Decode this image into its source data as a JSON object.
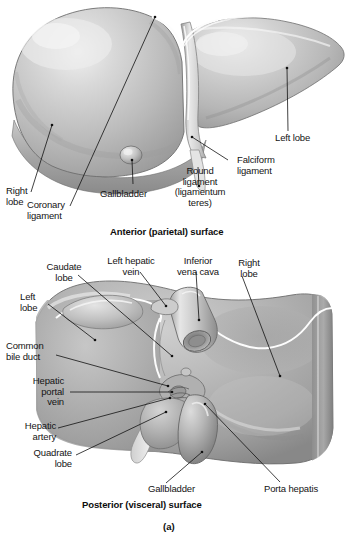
{
  "figure": {
    "panel_letter": "(a)",
    "colors": {
      "ink": "#141414",
      "leader_line": "#111111",
      "liver_mid": "#b4b4b4",
      "liver_light": "#dcdcdc",
      "liver_dark": "#8f8f8f",
      "highlight": "#f2f2f2",
      "background": "#ffffff"
    }
  },
  "panels": [
    {
      "id": "anterior",
      "caption": "Anterior (parietal) surface",
      "labels": [
        {
          "key": "right_lobe",
          "text": "Right\nlobe"
        },
        {
          "key": "coronary_lig",
          "text": "Coronary\nligament"
        },
        {
          "key": "gallbladder",
          "text": "Gallbladder"
        },
        {
          "key": "round_lig",
          "text": "Round\nligament\n(ligamentum\nteres)"
        },
        {
          "key": "falciform_lig",
          "text": "Falciform\nligament"
        },
        {
          "key": "left_lobe",
          "text": "Left lobe"
        }
      ]
    },
    {
      "id": "posterior",
      "caption": "Posterior (visceral) surface",
      "labels": [
        {
          "key": "caudate_lobe",
          "text": "Caudate\nlobe"
        },
        {
          "key": "left_hepatic_vein",
          "text": "Left hepatic\nvein"
        },
        {
          "key": "inferior_vena_cava",
          "text": "Inferior\nvena cava"
        },
        {
          "key": "right_lobe",
          "text": "Right\nlobe"
        },
        {
          "key": "left_lobe",
          "text": "Left\nlobe"
        },
        {
          "key": "common_bile_duct",
          "text": "Common\nbile duct"
        },
        {
          "key": "hepatic_portal_vein",
          "text": "Hepatic\nportal\nvein"
        },
        {
          "key": "hepatic_artery",
          "text": "Hepatic\nartery"
        },
        {
          "key": "quadrate_lobe",
          "text": "Quadrate\nlobe"
        },
        {
          "key": "gallbladder",
          "text": "Gallbladder"
        },
        {
          "key": "porta_hepatis",
          "text": "Porta hepatis"
        }
      ]
    }
  ]
}
